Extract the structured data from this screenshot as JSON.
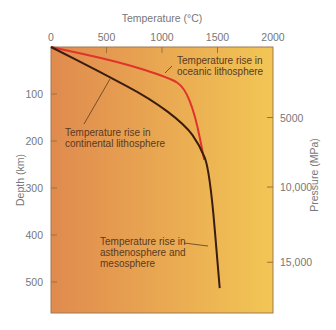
{
  "chart_data": {
    "type": "line",
    "title": "",
    "xlabel": "Temperature (°C)",
    "ylabel": "Depth (km)",
    "y2label": "Pressure (MPa)",
    "xlim": [
      0,
      2000
    ],
    "ylim": [
      0,
      565
    ],
    "x_ticks": [
      "0",
      "500",
      "1000",
      "1500",
      "2000"
    ],
    "y_ticks": [
      "100",
      "200",
      "300",
      "400",
      "500"
    ],
    "y2_ticks": [
      {
        "label": "5000",
        "depth_km": 150
      },
      {
        "label": "10,000",
        "depth_km": 298
      },
      {
        "label": "15,000",
        "depth_km": 458
      }
    ],
    "legend_position": "none",
    "grid": false,
    "series": [
      {
        "name": "Temperature rise in oceanic lithosphere",
        "color": "#e0332b",
        "points": [
          [
            0,
            0
          ],
          [
            620,
            32
          ],
          [
            1070,
            66
          ],
          [
            1200,
            85
          ],
          [
            1300,
            145
          ],
          [
            1380,
            240
          ]
        ]
      },
      {
        "name": "Temperature rise in continental lithosphere",
        "color": "#3a1d10",
        "points": [
          [
            0,
            0
          ],
          [
            440,
            53
          ],
          [
            890,
            109
          ],
          [
            1210,
            166
          ],
          [
            1340,
            209
          ],
          [
            1430,
            262
          ],
          [
            1520,
            513
          ]
        ]
      }
    ],
    "annotations": [
      {
        "text_lines": [
          "Temperature rise in",
          "oceanic lithosphere"
        ]
      },
      {
        "text_lines": [
          "Temperature rise in",
          "continental lithosphere"
        ]
      },
      {
        "text_lines": [
          "Temperature rise in",
          "asthenosphere and",
          "mesosphere"
        ]
      }
    ],
    "background_gradient": [
      "#e08a4e",
      "#f2c655"
    ]
  }
}
